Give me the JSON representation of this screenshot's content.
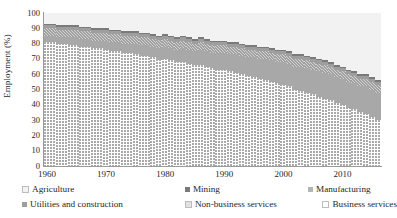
{
  "chart_data": {
    "type": "bar",
    "stacked": true,
    "stack_mode": "percent",
    "title": "",
    "xlabel": "",
    "ylabel": "Employment (%)",
    "ylim": [
      0,
      100
    ],
    "ytick_labels": [
      "0",
      "10",
      "20",
      "30",
      "40",
      "50",
      "60",
      "70",
      "80",
      "90",
      "100"
    ],
    "ytick_values": [
      0,
      10,
      20,
      30,
      40,
      50,
      60,
      70,
      80,
      90,
      100
    ],
    "xlim": [
      1960,
      2016
    ],
    "xtick_labels": [
      "1960",
      "1970",
      "1980",
      "1990",
      "2000",
      "2010"
    ],
    "xtick_values": [
      1960,
      1970,
      1980,
      1990,
      2000,
      2010
    ],
    "grid": false,
    "legend_position": "bottom",
    "x": [
      1960,
      1961,
      1962,
      1963,
      1964,
      1965,
      1966,
      1967,
      1968,
      1969,
      1970,
      1971,
      1972,
      1973,
      1974,
      1975,
      1976,
      1977,
      1978,
      1979,
      1980,
      1981,
      1982,
      1983,
      1984,
      1985,
      1986,
      1987,
      1988,
      1989,
      1990,
      1991,
      1992,
      1993,
      1994,
      1995,
      1996,
      1997,
      1998,
      1999,
      2000,
      2001,
      2002,
      2003,
      2004,
      2005,
      2006,
      2007,
      2008,
      2009,
      2010,
      2011,
      2012,
      2013,
      2014,
      2015,
      2016
    ],
    "series": [
      {
        "name": "Non-business services",
        "color": "#ffffff",
        "pattern": "dots",
        "values": [
          81,
          81,
          80,
          80,
          79,
          79,
          78,
          78,
          77,
          77,
          76,
          75,
          75,
          74,
          74,
          73,
          72,
          72,
          71,
          70,
          70,
          69,
          68,
          68,
          67,
          66,
          66,
          65,
          64,
          63,
          63,
          62,
          61,
          60,
          59,
          58,
          57,
          56,
          55,
          54,
          53,
          52,
          50,
          49,
          48,
          47,
          45,
          44,
          43,
          41,
          40,
          38,
          37,
          35,
          34,
          32,
          30
        ]
      },
      {
        "name": "Business services",
        "color": "#a8a8a8",
        "pattern": "solid",
        "values": [
          4,
          4,
          4,
          4,
          5,
          5,
          5,
          5,
          5,
          5,
          6,
          6,
          6,
          6,
          6,
          7,
          7,
          7,
          7,
          8,
          8,
          8,
          8,
          9,
          9,
          9,
          10,
          10,
          10,
          11,
          11,
          11,
          12,
          12,
          12,
          13,
          13,
          14,
          14,
          14,
          15,
          15,
          15,
          16,
          16,
          16,
          17,
          17,
          17,
          17,
          17,
          17,
          17,
          17,
          18,
          18,
          18
        ]
      },
      {
        "name": "Manufacturing",
        "color": "#d2d2d2",
        "pattern": "diagonal",
        "values": [
          5,
          5,
          5,
          5,
          5,
          5,
          5,
          5,
          5,
          5,
          5,
          5,
          5,
          5,
          5,
          5,
          5,
          5,
          5,
          5,
          5,
          5,
          5,
          5,
          5,
          5,
          5,
          5,
          5,
          5,
          5,
          5,
          5,
          5,
          5,
          5,
          5,
          5,
          5,
          5,
          5,
          5,
          5,
          5,
          5,
          5,
          5,
          5,
          5,
          5,
          5,
          5,
          5,
          5,
          5,
          5,
          5
        ]
      },
      {
        "name": "Utilities and construction",
        "color": "#9e9e9e",
        "pattern": "solid",
        "values": [
          2,
          2,
          2,
          2,
          2,
          2,
          2,
          2,
          2,
          2,
          2,
          2,
          2,
          2,
          2,
          2,
          2,
          2,
          2,
          2,
          2,
          2,
          2,
          2,
          2,
          2,
          2,
          2,
          2,
          2,
          2,
          2,
          2,
          2,
          2,
          2,
          2,
          2,
          2,
          2,
          2,
          2,
          2,
          2,
          2,
          2,
          2,
          2,
          2,
          2,
          2,
          2,
          2,
          2,
          2,
          2,
          2
        ]
      },
      {
        "name": "Mining",
        "color": "#7a7a7a",
        "pattern": "solid",
        "values": [
          1,
          1,
          1,
          1,
          1,
          1,
          1,
          1,
          1,
          1,
          1,
          1,
          1,
          1,
          1,
          1,
          1,
          1,
          1,
          1,
          1,
          1,
          1,
          1,
          1,
          1,
          1,
          1,
          1,
          1,
          1,
          1,
          1,
          1,
          1,
          1,
          1,
          1,
          1,
          1,
          1,
          1,
          1,
          1,
          1,
          1,
          1,
          1,
          1,
          1,
          1,
          1,
          1,
          1,
          1,
          1,
          1
        ]
      },
      {
        "name": "Agriculture",
        "color": "#f2f2f2",
        "pattern": "solid",
        "values": [
          7,
          7,
          8,
          8,
          8,
          8,
          9,
          9,
          10,
          10,
          10,
          11,
          11,
          12,
          12,
          12,
          13,
          13,
          14,
          15,
          14,
          15,
          16,
          15,
          16,
          17,
          16,
          17,
          18,
          18,
          18,
          19,
          19,
          20,
          21,
          21,
          22,
          22,
          23,
          24,
          24,
          25,
          27,
          27,
          28,
          29,
          30,
          31,
          32,
          34,
          35,
          37,
          38,
          40,
          40,
          42,
          44
        ]
      }
    ]
  },
  "axes": {
    "y_title": "Employment (%)"
  },
  "legend": {
    "row1": [
      {
        "label": "Agriculture",
        "swatch": "#f2f2f2",
        "left_pct": 0
      },
      {
        "label": "Mining",
        "swatch": "#7a7a7a",
        "left_pct": 45
      },
      {
        "label": "Manufacturing",
        "swatch": "#b4b4b4",
        "left_pct": 79
      }
    ],
    "row2": [
      {
        "label": "Utilities and construction",
        "swatch": "#9e9e9e",
        "left_pct": 0
      },
      {
        "label": "Non-business services",
        "swatch": "#e2e2e2",
        "left_pct": 45
      },
      {
        "label": "Business services",
        "swatch": "#ffffff",
        "left_pct": 83
      }
    ]
  }
}
